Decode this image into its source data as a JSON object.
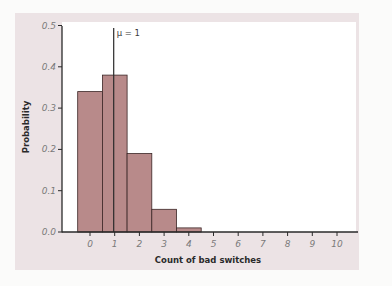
{
  "chart_data": {
    "type": "bar",
    "title": "",
    "xlabel": "Count of bad switches",
    "ylabel": "Probability",
    "categories": [
      "0",
      "1",
      "2",
      "3",
      "4",
      "5",
      "6",
      "7",
      "8",
      "9",
      "10"
    ],
    "values": [
      0.34,
      0.38,
      0.19,
      0.055,
      0.01,
      0,
      0,
      0,
      0,
      0,
      0
    ],
    "x_ticks": [
      "0",
      "1",
      "2",
      "3",
      "4",
      "5",
      "6",
      "7",
      "8",
      "9",
      "10"
    ],
    "y_ticks": [
      "0.0",
      "0.1",
      "0.2",
      "0.3",
      "0.4",
      "0.5"
    ],
    "ylim": [
      0,
      0.5
    ],
    "xlim": [
      -0.8,
      11.2
    ],
    "grid": false,
    "legend": null,
    "annotations": [
      {
        "type": "vline",
        "x": 1,
        "label": "μ = 1"
      }
    ],
    "colors": {
      "bar_fill": "#b88a8a",
      "bar_edge": "#3b2626",
      "panel_bg": "#ece3e5",
      "plot_bg": "#ffffff",
      "axis": "#2a2a2a"
    }
  },
  "labels": {
    "xlabel": "Count of bad switches",
    "ylabel": "Probability",
    "mean_annotation": "μ = 1"
  }
}
